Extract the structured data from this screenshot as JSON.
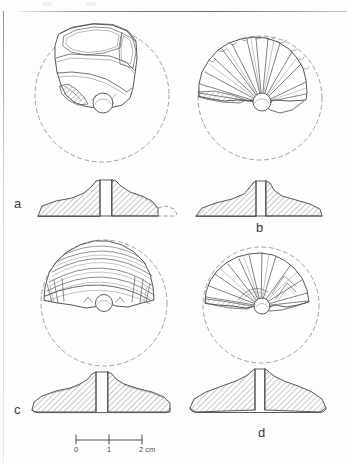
{
  "plate": {
    "kind": "archaeological-illustration-plate",
    "background_color": "#fdfdfd",
    "ink_color": "#55555c",
    "width": 347,
    "height": 463
  },
  "panels": [
    {
      "id": "a",
      "label": "a",
      "label_x": 14,
      "label_y": 196,
      "plan": {
        "center_x": 102,
        "center_y": 95,
        "radius": 67,
        "reconstruction": "dashed-circle",
        "description": "spindle whorl fragment, upper face with broad facets and central boss"
      },
      "section": {
        "center_x": 101,
        "base_y": 216,
        "half_width": 76,
        "description": "hatched profile with central perforation band and dashed reconstructed edge at right"
      }
    },
    {
      "id": "b",
      "label": "b",
      "label_x": 256,
      "label_y": 223,
      "plan": {
        "center_x": 260,
        "center_y": 98,
        "radius": 62,
        "reconstruction": "dashed-circle",
        "description": "fragment with radiating fan of flake scars converging on central boss"
      },
      "section": {
        "center_x": 258,
        "base_y": 216,
        "half_width": 71,
        "description": "hatched profile, low dome with central perforation band"
      }
    },
    {
      "id": "c",
      "label": "c",
      "label_x": 14,
      "label_y": 405,
      "plan": {
        "center_x": 104,
        "center_y": 303,
        "radius": 63,
        "reconstruction": "dashed-circle",
        "description": "fragment with concentric arc grooves across upper half and central boss"
      },
      "section": {
        "center_x": 101,
        "base_y": 412,
        "half_width": 75,
        "description": "hatched profile, shallow cone with central perforation band"
      }
    },
    {
      "id": "d",
      "label": "d",
      "label_x": 258,
      "label_y": 428,
      "plan": {
        "center_x": 261,
        "center_y": 305,
        "radius": 58,
        "reconstruction": "dashed-circle",
        "description": "fragment with chevron and radial flake scars above central boss"
      },
      "section": {
        "center_x": 258,
        "base_y": 411,
        "half_width": 68,
        "description": "hatched profile, low dome with central perforation band"
      }
    }
  ],
  "scale_bar": {
    "x": 76,
    "y": 437,
    "length_px": 66,
    "ticks": [
      {
        "label": "0",
        "value": 0
      },
      {
        "label": "1",
        "value": 1
      },
      {
        "label": "2 cm",
        "value": 2
      }
    ],
    "unit": "cm",
    "max_value": 2
  }
}
